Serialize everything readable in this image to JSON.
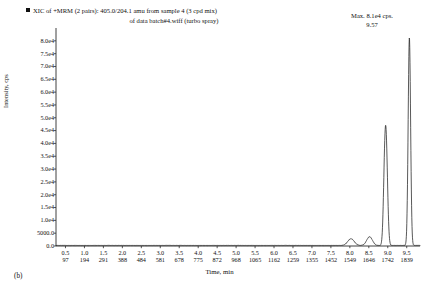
{
  "figure": {
    "panel_label": "(b)",
    "legend_marker": "filled-square",
    "title_line1": "XIC of +MRM (2 pairs): 405.0/204.1 amu from sample 4 (3 cpd mix)",
    "title_line2": "of data batch#4.wiff (turbo spray)",
    "max_text": "Max. 8.1e4 cps.",
    "peak_label": "9.57"
  },
  "chart_data": {
    "type": "line",
    "title": "XIC of +MRM (2 pairs): 405.0/204.1 amu from sample 4 (3 cpd mix) of data batch#4.wiff (turbo spray)",
    "xlabel": "Time, min",
    "ylabel": "Intensity, cps",
    "xlim": [
      0.25,
      9.85
    ],
    "ylim": [
      0,
      85000
    ],
    "grid": false,
    "legend_position": "top-left",
    "annotations": [
      {
        "text": "Max. 8.1e4 cps.",
        "position": "top-right"
      },
      {
        "text": "9.57",
        "x": 9.57,
        "y": 81000
      }
    ],
    "y_ticks": [
      {
        "value": 0,
        "label": "0.0"
      },
      {
        "value": 5000,
        "label": "5000.0"
      },
      {
        "value": 10000,
        "label": "1.0e4"
      },
      {
        "value": 15000,
        "label": "1.5e4"
      },
      {
        "value": 20000,
        "label": "2.0e4"
      },
      {
        "value": 25000,
        "label": "2.5e4"
      },
      {
        "value": 30000,
        "label": "3.0e4"
      },
      {
        "value": 35000,
        "label": "3.5e4"
      },
      {
        "value": 40000,
        "label": "4.0e4"
      },
      {
        "value": 45000,
        "label": "4.5e4"
      },
      {
        "value": 50000,
        "label": "5.0e4"
      },
      {
        "value": 55000,
        "label": "5.5e4"
      },
      {
        "value": 60000,
        "label": "6.0e4"
      },
      {
        "value": 65000,
        "label": "6.5e4"
      },
      {
        "value": 70000,
        "label": "7.0e4"
      },
      {
        "value": 75000,
        "label": "7.5e4"
      },
      {
        "value": 80000,
        "label": "8.0e4"
      }
    ],
    "x_ticks": [
      {
        "time": "0.5",
        "scan": "97"
      },
      {
        "time": "1.0",
        "scan": "194"
      },
      {
        "time": "1.5",
        "scan": "291"
      },
      {
        "time": "2.0",
        "scan": "388"
      },
      {
        "time": "2.5",
        "scan": "484"
      },
      {
        "time": "3.0",
        "scan": "581"
      },
      {
        "time": "3.5",
        "scan": "678"
      },
      {
        "time": "4.0",
        "scan": "775"
      },
      {
        "time": "4.5",
        "scan": "872"
      },
      {
        "time": "5.0",
        "scan": "968"
      },
      {
        "time": "5.5",
        "scan": "1065"
      },
      {
        "time": "6.0",
        "scan": "1162"
      },
      {
        "time": "6.5",
        "scan": "1259"
      },
      {
        "time": "7.0",
        "scan": "1355"
      },
      {
        "time": "7.5",
        "scan": "1452"
      },
      {
        "time": "8.0",
        "scan": "1549"
      },
      {
        "time": "8.5",
        "scan": "1646"
      },
      {
        "time": "9.0",
        "scan": "1742"
      },
      {
        "time": "9.5",
        "scan": "1839"
      }
    ],
    "series": [
      {
        "name": "XIC 405.0/204.1",
        "color": "#1a1a1a",
        "peaks": [
          {
            "center": 8.03,
            "height": 2600,
            "width": 0.085,
            "label": ""
          },
          {
            "center": 8.52,
            "height": 3400,
            "width": 0.075,
            "label": ""
          },
          {
            "center": 8.96,
            "height": 35200,
            "width": 0.038,
            "label": "",
            "shoulder_height": 21000,
            "shoulder_center": 8.915
          },
          {
            "center": 9.57,
            "height": 81000,
            "width": 0.032,
            "label": "9.57"
          }
        ],
        "baseline": 250
      }
    ]
  }
}
